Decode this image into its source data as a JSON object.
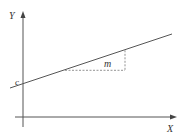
{
  "diagram": {
    "axes": {
      "x_label": "X",
      "y_label": "Y"
    },
    "labels": {
      "intercept": "c",
      "gradient": "m"
    },
    "colors": {
      "axis": "#555555",
      "line": "#555555",
      "dashed": "#777777",
      "text": "#333333"
    }
  }
}
